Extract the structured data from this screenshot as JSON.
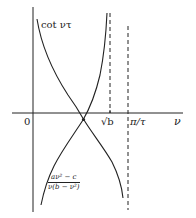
{
  "diagram": {
    "type": "function-intersection-sketch",
    "colors": {
      "ink": "#222222",
      "background": "#ffffff"
    },
    "axes": {
      "origin_label": "0",
      "x_axis_label": "ν"
    },
    "markers": {
      "sqrt_b_label": "√b",
      "pi_over_tau_label": "π/τ"
    },
    "curves": [
      {
        "name": "cot",
        "label": "cot ντ"
      },
      {
        "name": "rational",
        "label_numerator": "aν² − c",
        "label_denominator": "ν(b − ν²)"
      }
    ]
  }
}
